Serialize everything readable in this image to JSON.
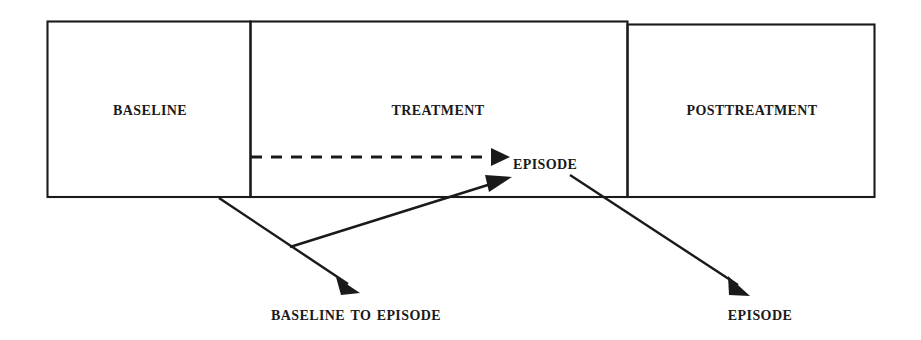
{
  "diagram": {
    "type": "timeline-phase-diagram",
    "stroke_color": "#1a1a1a",
    "text_color": "#1a1a1a",
    "background_color": "#ffffff",
    "phases": [
      {
        "id": "baseline",
        "label": "Baseline"
      },
      {
        "id": "treatment",
        "label": "Treatment"
      },
      {
        "id": "posttreatment",
        "label": "Posttreatment"
      }
    ],
    "nodes": [
      {
        "id": "episode",
        "label": "Episode"
      }
    ],
    "captions": [
      {
        "id": "baseline-to-episode",
        "label": "Baseline to Episode"
      },
      {
        "id": "episode",
        "label": "Episode"
      }
    ],
    "connectors": [
      {
        "id": "treatment-to-episode",
        "style": "dashed",
        "arrowhead": "filled-triangle"
      },
      {
        "id": "junction-to-episode",
        "style": "solid",
        "arrowhead": "filled-triangle"
      },
      {
        "id": "baseline-edge-to-caption",
        "style": "solid",
        "arrowhead": "filled-triangle"
      },
      {
        "id": "episode-to-caption",
        "style": "solid",
        "arrowhead": "filled-triangle"
      }
    ]
  }
}
